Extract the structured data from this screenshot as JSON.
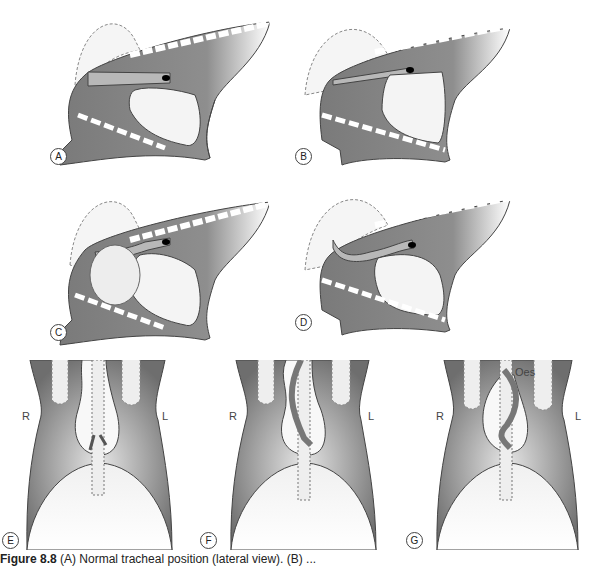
{
  "figure": {
    "panels": [
      {
        "id": "A",
        "label": "A",
        "view": "lateral",
        "description": "Normal tracheal position"
      },
      {
        "id": "B",
        "label": "B",
        "view": "lateral",
        "description": "Trachea elevated dorsally"
      },
      {
        "id": "C",
        "label": "C",
        "view": "lateral",
        "description": "Cranial mediastinal mass displacing trachea"
      },
      {
        "id": "D",
        "label": "D",
        "view": "lateral",
        "description": "Trachea displaced ventrally"
      },
      {
        "id": "E",
        "label": "E",
        "view": "ventrodorsal",
        "description": "Normal position"
      },
      {
        "id": "F",
        "label": "F",
        "view": "ventrodorsal",
        "description": "Trachea deviated"
      },
      {
        "id": "G",
        "label": "G",
        "view": "ventrodorsal",
        "description": "Oesophagus annotated"
      }
    ],
    "side_labels": {
      "right": "R",
      "left": "L"
    },
    "annotation_oes": "Oes",
    "caption": {
      "prefix": "Figure 8.8",
      "text": " (A) Normal tracheal position (lateral view). (B) ..."
    }
  },
  "colors": {
    "thorax_dark": "#6e6e6e",
    "thorax_mid": "#9a9a9a",
    "heart_fill": "#f2f2f2",
    "trachea": "#b8b8b8",
    "outline": "#333333"
  }
}
